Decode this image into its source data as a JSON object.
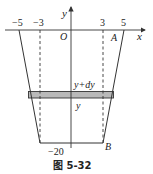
{
  "figure": {
    "caption": "图 5-32",
    "axes": {
      "x_label": "x",
      "y_label": "y",
      "origin_label": "O"
    },
    "ticks": {
      "neg5": "−5",
      "neg3": "−3",
      "pos3": "3",
      "pos5": "5",
      "neg20": "−20"
    },
    "points": {
      "A": "A",
      "B": "B"
    },
    "strip": {
      "upper_label": "y+dy",
      "lower_label": "y",
      "fill_color": "#b9b9b9"
    },
    "colors": {
      "line": "#333333",
      "background": "#ffffff"
    }
  }
}
